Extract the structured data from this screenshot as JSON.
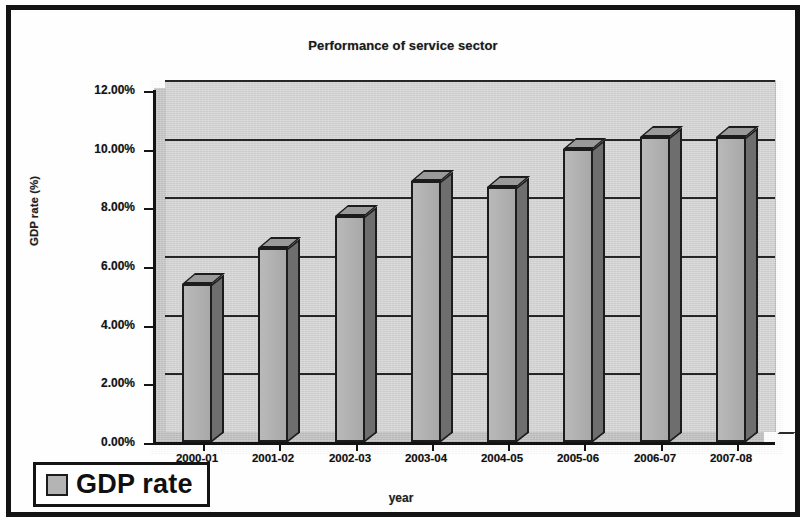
{
  "chart_data": {
    "type": "bar",
    "title": "Performance of service sector",
    "xlabel": "year",
    "ylabel": "GDP rate (%)",
    "categories": [
      "2000-01",
      "2001-02",
      "2002-03",
      "2003-04",
      "2004-05",
      "2005-06",
      "2006-07",
      "2007-08"
    ],
    "series": [
      {
        "name": "GDP rate",
        "values": [
          5.4,
          6.6,
          7.7,
          8.9,
          8.7,
          10.0,
          10.4,
          10.4
        ]
      }
    ],
    "ylim": [
      0,
      12
    ],
    "ytick_values": [
      0,
      2,
      4,
      6,
      8,
      10,
      12
    ],
    "ytick_labels": [
      "0.00%",
      "2.00%",
      "4.00%",
      "6.00%",
      "8.00%",
      "10.00%",
      "12.00%"
    ],
    "grid": true,
    "legend_position": "bottom-left",
    "style": "3d-column",
    "colors": {
      "bar_front": "#b4b4b4",
      "bar_side": "#6e6e6e",
      "bar_top": "#9a9a9a",
      "plot_background": "#d2d2d2",
      "axis": "#131313",
      "gridline": "#262626",
      "frame": "#141414",
      "text": "#111111"
    }
  },
  "legend": {
    "label": "GDP rate"
  }
}
